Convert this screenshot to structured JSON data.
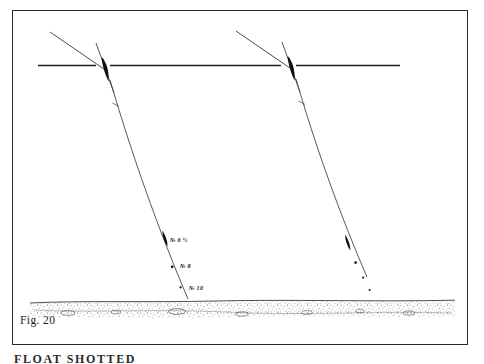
{
  "figure": {
    "caption": "Fig. 20",
    "title_below_plate": "FLOAT  SHOTTED",
    "domain_note": "antique angling plate",
    "ink_color": "#1a1a1a",
    "paper_color": "#ffffff",
    "frame_color": "#2b2b2b"
  },
  "scene": {
    "waterline_label": "water-surface-line",
    "riverbed_label": "gravel-riverbed",
    "rigs": [
      {
        "name": "left-rig",
        "float_label": "quill-float",
        "shot": [
          {
            "label": "№ 6 ½"
          },
          {
            "label": "№ 8"
          },
          {
            "label": "№ 10"
          }
        ]
      },
      {
        "name": "right-rig",
        "float_label": "quill-float",
        "shot": [
          {
            "label": ""
          },
          {
            "label": ""
          },
          {
            "label": ""
          }
        ]
      }
    ]
  }
}
